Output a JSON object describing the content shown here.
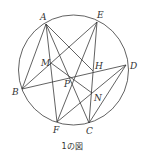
{
  "figure": {
    "caption": "1の図",
    "circle": {
      "cx": 73.5,
      "cy": 70,
      "r": 55
    },
    "points": {
      "A": {
        "label": "A",
        "x": 46,
        "y": 24
      },
      "E": {
        "label": "E",
        "x": 97,
        "y": 22
      },
      "D": {
        "label": "D",
        "x": 126,
        "y": 65
      },
      "B": {
        "label": "B",
        "x": 22,
        "y": 89
      },
      "F": {
        "label": "F",
        "x": 57,
        "y": 122
      },
      "C": {
        "label": "C",
        "x": 89,
        "y": 123
      },
      "M": {
        "label": "M",
        "x": 51,
        "y": 63
      },
      "H": {
        "label": "H",
        "x": 93,
        "y": 71
      },
      "P": {
        "label": "P",
        "x": 72,
        "y": 78
      },
      "N": {
        "label": "N",
        "x": 92,
        "y": 93
      }
    },
    "segments": [
      [
        "A",
        "B"
      ],
      [
        "A",
        "F"
      ],
      [
        "A",
        "C"
      ],
      [
        "A",
        "H"
      ],
      [
        "E",
        "B"
      ],
      [
        "E",
        "F"
      ],
      [
        "E",
        "C"
      ],
      [
        "B",
        "D"
      ],
      [
        "D",
        "F"
      ],
      [
        "D",
        "C"
      ],
      [
        "M",
        "N"
      ]
    ]
  }
}
